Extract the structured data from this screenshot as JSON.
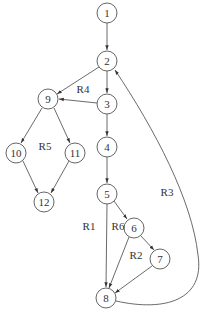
{
  "diagram": {
    "type": "control-flow-graph",
    "nodes": [
      {
        "id": "1",
        "label": "1",
        "x": 107,
        "y": 13
      },
      {
        "id": "2",
        "label": "2",
        "x": 107,
        "y": 61
      },
      {
        "id": "3",
        "label": "3",
        "x": 107,
        "y": 104
      },
      {
        "id": "4",
        "label": "4",
        "x": 107,
        "y": 147
      },
      {
        "id": "5",
        "label": "5",
        "x": 107,
        "y": 194
      },
      {
        "id": "6",
        "label": "6",
        "x": 134,
        "y": 228
      },
      {
        "id": "7",
        "label": "7",
        "x": 160,
        "y": 259
      },
      {
        "id": "8",
        "label": "8",
        "x": 106,
        "y": 298
      },
      {
        "id": "9",
        "label": "9",
        "x": 48,
        "y": 99
      },
      {
        "id": "10",
        "label": "10",
        "x": 16,
        "y": 153
      },
      {
        "id": "11",
        "label": "11",
        "x": 75,
        "y": 153
      },
      {
        "id": "12",
        "label": "12",
        "x": 44,
        "y": 202
      }
    ],
    "edges": [
      {
        "from": "1",
        "to": "2"
      },
      {
        "from": "2",
        "to": "3"
      },
      {
        "from": "2",
        "to": "9"
      },
      {
        "from": "3",
        "to": "9"
      },
      {
        "from": "3",
        "to": "4"
      },
      {
        "from": "4",
        "to": "5"
      },
      {
        "from": "5",
        "to": "8"
      },
      {
        "from": "5",
        "to": "6"
      },
      {
        "from": "6",
        "to": "8"
      },
      {
        "from": "6",
        "to": "7"
      },
      {
        "from": "7",
        "to": "8"
      },
      {
        "from": "8",
        "to": "2",
        "curved": true
      },
      {
        "from": "9",
        "to": "10"
      },
      {
        "from": "9",
        "to": "11"
      },
      {
        "from": "10",
        "to": "12"
      },
      {
        "from": "11",
        "to": "12"
      }
    ],
    "regions": [
      {
        "label": "R1",
        "x": 89,
        "y": 230
      },
      {
        "label": "R2",
        "x": 136,
        "y": 259
      },
      {
        "label": "R3",
        "x": 167,
        "y": 196
      },
      {
        "label": "R4",
        "x": 83,
        "y": 93
      },
      {
        "label": "R5",
        "x": 45,
        "y": 150
      },
      {
        "label": "R6",
        "x": 118,
        "y": 230
      }
    ]
  }
}
